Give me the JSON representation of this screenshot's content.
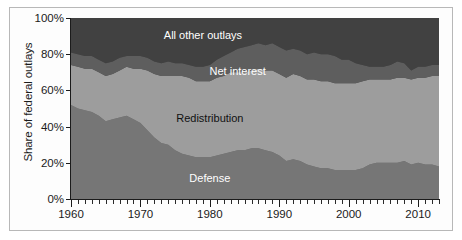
{
  "chart_data": {
    "type": "area",
    "stacked": true,
    "title": "",
    "subtitle": "",
    "xlabel": "",
    "ylabel": "Share of federal outlays",
    "xlim": [
      1960,
      2013
    ],
    "ylim": [
      0,
      100
    ],
    "grid": false,
    "legend_position": "inline-labels",
    "y_tick_labels": [
      "0%",
      "20%",
      "40%",
      "60%",
      "80%",
      "100%"
    ],
    "y_tick_values": [
      0,
      20,
      40,
      60,
      80,
      100
    ],
    "x_tick_labels": [
      "1960",
      "1970",
      "1980",
      "1990",
      "2000",
      "2010"
    ],
    "x_tick_values": [
      1960,
      1970,
      1980,
      1990,
      2000,
      2010
    ],
    "x_minor_tick_interval": 1,
    "colors": {
      "defense": "#767676",
      "redistribution": "#9d9d9d",
      "net_interest": "#5e5e5e",
      "all_other_outlays": "#414141",
      "axis": "#1b1b1b",
      "frame": "#b8b8b8",
      "background": "#fdfdfd"
    },
    "x": [
      1960,
      1961,
      1962,
      1963,
      1964,
      1965,
      1966,
      1967,
      1968,
      1969,
      1970,
      1971,
      1972,
      1973,
      1974,
      1975,
      1976,
      1977,
      1978,
      1979,
      1980,
      1981,
      1982,
      1983,
      1984,
      1985,
      1986,
      1987,
      1988,
      1989,
      1990,
      1991,
      1992,
      1993,
      1994,
      1995,
      1996,
      1997,
      1998,
      1999,
      2000,
      2001,
      2002,
      2003,
      2004,
      2005,
      2006,
      2007,
      2008,
      2009,
      2010,
      2011,
      2012,
      2013
    ],
    "series": [
      {
        "name": "Defense",
        "label": "Defense",
        "color": "#767676",
        "label_color": "#ffffff",
        "label_x": 1980,
        "label_y": 11,
        "values": [
          52,
          50,
          49,
          48,
          46,
          43,
          44,
          45,
          46,
          44,
          42,
          38,
          34,
          31,
          30,
          27,
          25,
          24,
          23,
          23,
          23,
          24,
          25,
          26,
          27,
          27,
          28,
          28,
          27,
          26,
          24,
          21,
          22,
          21,
          19,
          18,
          17,
          17,
          16,
          16,
          16,
          16,
          17,
          19,
          20,
          20,
          20,
          20,
          21,
          19,
          20,
          19,
          19,
          18
        ]
      },
      {
        "name": "Redistribution",
        "label": "Redistribution",
        "color": "#9d9d9d",
        "label_color": "#111111",
        "label_x": 1980,
        "label_y": 44,
        "values": [
          22,
          23,
          23,
          24,
          24,
          25,
          25,
          26,
          27,
          28,
          30,
          33,
          35,
          37,
          38,
          41,
          43,
          43,
          42,
          42,
          42,
          43,
          43,
          44,
          43,
          43,
          43,
          44,
          44,
          45,
          45,
          46,
          47,
          47,
          47,
          48,
          48,
          48,
          48,
          48,
          48,
          48,
          48,
          47,
          46,
          46,
          46,
          47,
          46,
          47,
          47,
          48,
          49,
          50
        ]
      },
      {
        "name": "Net interest",
        "label": "Net interest",
        "color": "#5e5e5e",
        "label_color": "#ffffff",
        "label_x": 1984,
        "label_y": 70,
        "values": [
          7,
          7,
          7,
          7,
          7,
          7,
          7,
          7,
          6,
          7,
          7,
          7,
          7,
          7,
          8,
          7,
          7,
          7,
          8,
          8,
          9,
          10,
          11,
          11,
          13,
          14,
          14,
          14,
          14,
          15,
          15,
          15,
          14,
          14,
          14,
          15,
          15,
          15,
          15,
          13,
          13,
          11,
          9,
          7,
          7,
          7,
          8,
          9,
          8,
          5,
          6,
          6,
          6,
          6
        ]
      },
      {
        "name": "All other outlays",
        "label": "All other outlays",
        "color": "#414141",
        "label_color": "#ffffff",
        "label_x": 1979,
        "label_y": 90,
        "values": [
          19,
          20,
          21,
          21,
          23,
          25,
          24,
          22,
          21,
          21,
          21,
          22,
          24,
          25,
          24,
          25,
          25,
          26,
          27,
          27,
          26,
          23,
          21,
          19,
          17,
          16,
          15,
          14,
          15,
          14,
          16,
          18,
          17,
          18,
          20,
          19,
          20,
          20,
          21,
          23,
          23,
          25,
          26,
          27,
          27,
          27,
          26,
          24,
          25,
          29,
          27,
          27,
          26,
          26
        ]
      }
    ]
  }
}
